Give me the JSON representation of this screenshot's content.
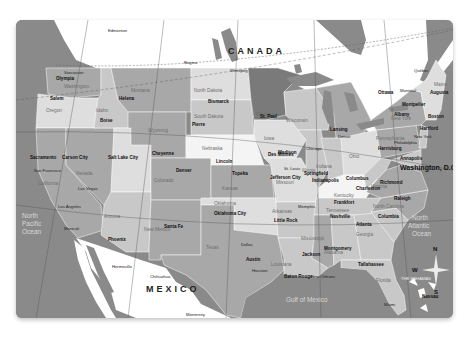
{
  "map": {
    "title_countries": {
      "canada": "CANADA",
      "mexico": "MEXICO"
    },
    "oceans": {
      "pacific": [
        "North",
        "Pacific",
        "Ocean"
      ],
      "atlantic": [
        "North",
        "Atlantic",
        "Ocean"
      ],
      "gulf": "Gulf of Mexico"
    },
    "regions": {
      "bahamas": "THE BAHAMAS"
    },
    "compass": {
      "n": "N",
      "s": "S",
      "e": "E",
      "w": "W"
    },
    "colors": {
      "ocean": "#8a8a8a",
      "foreign_land": "#ffffff",
      "dark_state": "#7a7a7a",
      "mid_state": "#a8a8a8",
      "light_state": "#c8c8c8",
      "pale_state": "#dedede",
      "white_state": "#f4f4f4"
    },
    "states": {
      "washington": "Washington",
      "oregon": "Oregon",
      "california": "California",
      "nevada": "Nevada",
      "idaho": "Idaho",
      "montana": "Montana",
      "wyoming": "Wyoming",
      "utah": "Utah",
      "arizona": "Arizona",
      "colorado": "Colorado",
      "new_mexico": "New Mexico",
      "north_dakota": "North Dakota",
      "south_dakota": "South Dakota",
      "nebraska": "Nebraska",
      "kansas": "Kansas",
      "oklahoma": "Oklahoma",
      "texas": "Texas",
      "minnesota": "Minnesota",
      "iowa": "Iowa",
      "missouri": "Missouri",
      "arkansas": "Arkansas",
      "louisiana": "Louisiana",
      "wisconsin": "Wisconsin",
      "illinois": "Illinois",
      "michigan": "Michigan",
      "indiana": "Indiana",
      "ohio": "Ohio",
      "kentucky": "Kentucky",
      "tennessee": "Tennessee",
      "mississippi": "Mississippi",
      "alabama": "Alabama",
      "georgia": "Georgia",
      "florida": "Florida",
      "south_carolina": "South Carolina",
      "north_carolina": "North Carolina",
      "virginia": "Virginia",
      "west_virginia": "West Virginia",
      "pennsylvania": "Pennsylvania",
      "new_york": "New York",
      "maine": "Maine",
      "new_jersey": "New Jersey",
      "delaware": "Delaware"
    },
    "capitals": {
      "olympia": "Olympia",
      "salem": "Salem",
      "sacramento": "Sacramento",
      "carson_city": "Carson City",
      "boise": "Boise",
      "helena": "Helena",
      "salt_lake_city": "Salt Lake City",
      "cheyenne": "Cheyenne",
      "denver": "Denver",
      "phoenix": "Phoenix",
      "santa_fe": "Santa Fe",
      "bismarck": "Bismarck",
      "pierre": "Pierre",
      "lincoln": "Lincoln",
      "topeka": "Topeka",
      "oklahoma_city": "Oklahoma City",
      "austin": "Austin",
      "st_paul": "St. Paul",
      "des_moines": "Des Moines",
      "jefferson_city": "Jefferson City",
      "little_rock": "Little Rock",
      "baton_rouge": "Baton Rouge",
      "madison": "Madison",
      "springfield": "Springfield",
      "lansing": "Lansing",
      "indianapolis": "Indianapolis",
      "columbus_oh": "Columbus",
      "frankfort": "Frankfort",
      "nashville": "Nashville",
      "jackson": "Jackson",
      "montgomery": "Montgomery",
      "atlanta": "Atlanta",
      "tallahassee": "Tallahassee",
      "columbia": "Columbia",
      "raleigh": "Raleigh",
      "richmond": "Richmond",
      "charleston": "Charleston",
      "harrisburg": "Harrisburg",
      "annapolis": "Annapolis",
      "dover": "Dover",
      "trenton": "Trenton",
      "albany": "Albany",
      "hartford": "Hartford",
      "providence": "Providence",
      "boston": "Boston",
      "concord": "Concord",
      "montpelier": "Montpelier",
      "augusta": "Augusta",
      "washington_dc": "Washington, D.C.",
      "ottawa": "Ottawa",
      "nassau": "Nassau"
    },
    "cities": {
      "seattle": "Seattle",
      "vancouver": "Vancouver",
      "edmonton": "Edmonton",
      "regina": "Regina",
      "winnipeg": "Winnipeg",
      "montreal": "Montreal",
      "quebec": "Québec",
      "san_francisco": "San Francisco",
      "los_angeles": "Los Angeles",
      "las_vegas": "Las Vegas",
      "mexicali": "Mexicali",
      "hermosillo": "Hermosillo",
      "chihuahua": "Chihuahua",
      "monterrey": "Monterrey",
      "dallas": "Dallas",
      "houston": "Houston",
      "new_orleans": "New Orleans",
      "memphis": "Memphis",
      "st_louis": "St. Louis",
      "chicago": "Chicago",
      "detroit": "Detroit",
      "philadelphia": "Philadelphia",
      "new_york_city": "New York",
      "miami": "Miami",
      "toronto": "Toronto"
    },
    "longitude_ticks": [
      "120",
      "110",
      "100",
      "90",
      "80",
      "70"
    ]
  }
}
